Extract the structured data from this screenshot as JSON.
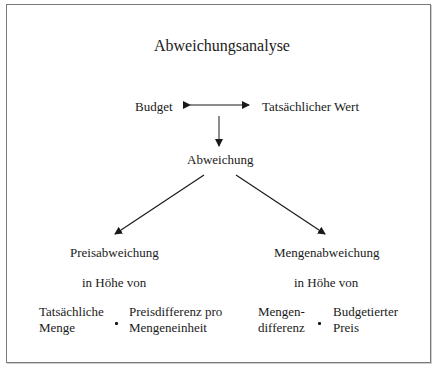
{
  "diagram": {
    "title": "Abweichungsanalyse",
    "top_row": {
      "left": "Budget",
      "right": "Tatsächlicher Wert",
      "connector": "double-arrow"
    },
    "center": "Abweichung",
    "branches": [
      {
        "name": "Preisabweichung",
        "subtitle": "in Höhe von",
        "factor_a_line1": "Tatsächliche",
        "factor_a_line2": "Menge",
        "operator": "•",
        "factor_b_line1": "Preisdifferenz pro",
        "factor_b_line2": "Mengeneinheit"
      },
      {
        "name": "Mengenabweichung",
        "subtitle": "in Höhe von",
        "factor_a_line1": "Mengen-",
        "factor_a_line2": "differenz",
        "operator": "•",
        "factor_b_line1": "Budgetierter",
        "factor_b_line2": "Preis"
      }
    ],
    "colors": {
      "line": "#1a1a1a",
      "border": "#7a7a7a",
      "background": "#ffffff"
    }
  }
}
